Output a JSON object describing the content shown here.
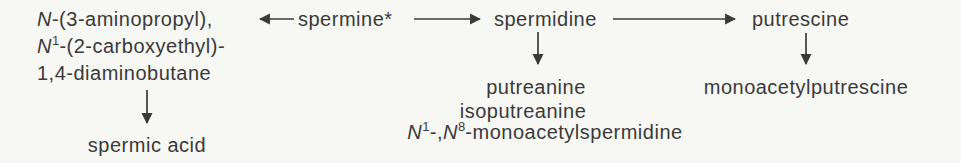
{
  "diagram": {
    "nodes": {
      "left_compound": {
        "line1_n": "N",
        "line1_rest": "-(3-aminopropyl),",
        "line2_n": "N",
        "line2_sup": "1",
        "line2_rest": "-(2-carboxyethyl)-",
        "line3": "1,4-diaminobutane"
      },
      "spermine": "spermine*",
      "spermidine": "spermidine",
      "putrescine": "putrescine",
      "spermic_acid": "spermic acid",
      "putreanine": "putreanine",
      "isoputreanine": "isoputreanine",
      "monoacetylspermidine": {
        "n1": "N",
        "sup1": "1",
        "sep": "-,",
        "n2": "N",
        "sup2": "8",
        "rest": "-monoacetylspermidine"
      },
      "monoacetylputrescine": "monoacetylputrescine"
    },
    "edges": [
      {
        "from": "spermine",
        "to": "left_compound",
        "direction": "left"
      },
      {
        "from": "spermine",
        "to": "spermidine",
        "direction": "right"
      },
      {
        "from": "spermidine",
        "to": "putrescine",
        "direction": "right"
      },
      {
        "from": "left_compound",
        "to": "spermic_acid",
        "direction": "down"
      },
      {
        "from": "spermidine",
        "to": "putreanine",
        "direction": "down"
      },
      {
        "from": "putrescine",
        "to": "monoacetylputrescine",
        "direction": "down"
      }
    ],
    "colors": {
      "background": "#f7f7f4",
      "text": "#3a3a3a",
      "arrow": "#3a3a3a"
    }
  }
}
